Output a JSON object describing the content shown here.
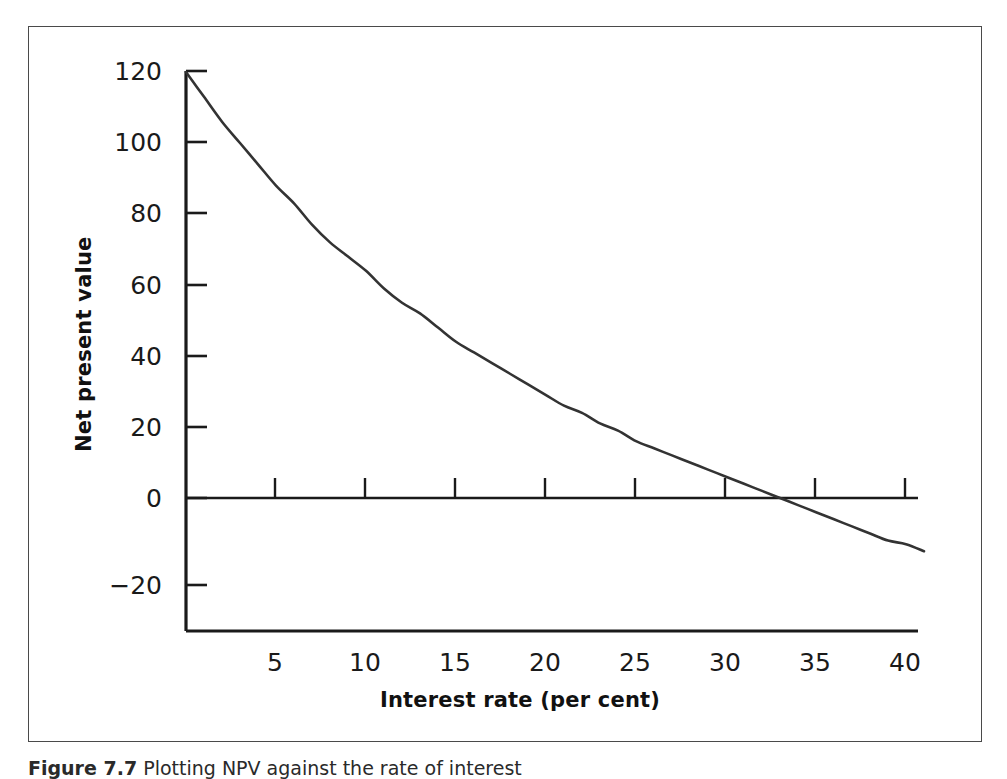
{
  "figure": {
    "caption_label": "Figure 7.7",
    "caption_text": "Plotting NPV against the rate of interest"
  },
  "axes": {
    "y_title": "Net present value",
    "x_title": "Interest rate (per cent)",
    "y_ticks": [
      "120",
      "100",
      "80",
      "60",
      "40",
      "20",
      "0",
      "−20"
    ],
    "x_ticks": [
      "5",
      "10",
      "15",
      "20",
      "25",
      "30",
      "35",
      "40"
    ]
  },
  "chart_data": {
    "type": "line",
    "title": "",
    "subtitle": "",
    "xlabel": "Interest rate (per cent)",
    "ylabel": "Net present value",
    "xlim": [
      0,
      41
    ],
    "ylim": [
      -20,
      120
    ],
    "xticks": [
      5,
      10,
      15,
      20,
      25,
      30,
      35,
      40
    ],
    "yticks": [
      -20,
      0,
      20,
      40,
      60,
      80,
      100,
      120
    ],
    "grid": false,
    "legend": "none",
    "annotations": [
      {
        "text": "zero line",
        "y": 0,
        "type": "horizontal-reference-line"
      }
    ],
    "series": [
      {
        "name": "Net present value",
        "color": "#333333",
        "x": [
          0,
          1,
          2,
          3,
          4,
          5,
          6,
          7,
          8,
          9,
          10,
          11,
          12,
          13,
          14,
          15,
          16,
          17,
          18,
          19,
          20,
          21,
          22,
          23,
          24,
          25,
          26,
          27,
          28,
          29,
          30,
          31,
          32,
          33,
          34,
          35,
          36,
          37,
          38,
          39,
          40,
          41
        ],
        "y": [
          120,
          113,
          106,
          100,
          94,
          88,
          83,
          77,
          72,
          68,
          64,
          59,
          55,
          52,
          48,
          44,
          41,
          38,
          35,
          32,
          29,
          26,
          24,
          21,
          19,
          16,
          14,
          12,
          10,
          8,
          6,
          4,
          2,
          0,
          -2,
          -4,
          -6,
          -8,
          -10,
          -12,
          -13,
          -15
        ]
      }
    ],
    "zero_crossing": {
      "x": 29,
      "y": 0,
      "label": "IRR"
    }
  },
  "colors": {
    "curve": "#333333",
    "axis": "#1a1a1a",
    "frame": "#4a4a4a",
    "background": "#ffffff"
  }
}
